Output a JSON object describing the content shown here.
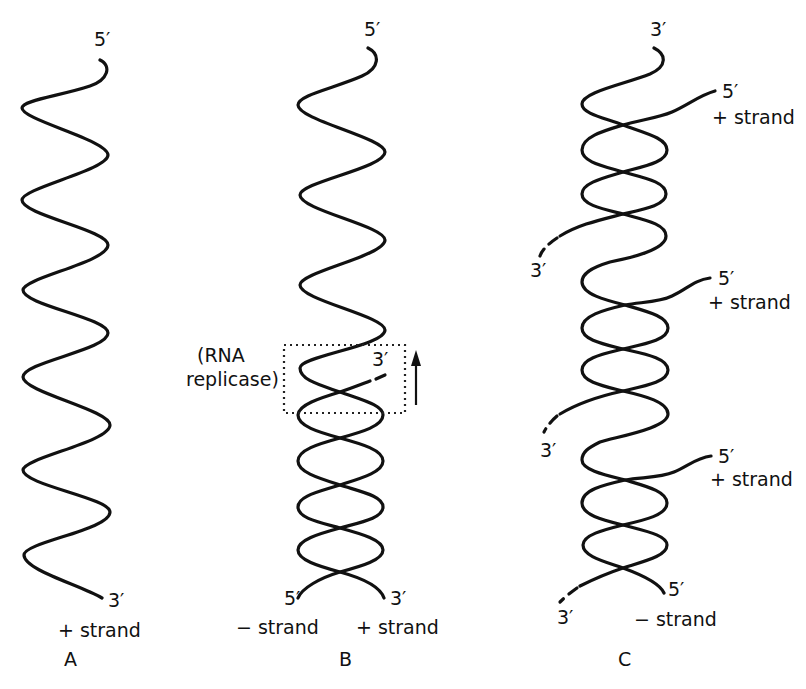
{
  "figure": {
    "panels": [
      {
        "id": "A",
        "label": "A",
        "top_end": "5′",
        "bottom_end": "3′",
        "strand_label": "+ strand"
      },
      {
        "id": "B",
        "label": "B",
        "top_end": "5′",
        "enzyme_label_line1": "(RNA",
        "enzyme_label_line2": "replicase)",
        "growing_end": "3′",
        "bottom_left_end": "5′",
        "bottom_right_end": "3′",
        "minus_strand_label": "− strand",
        "plus_strand_label": "+ strand"
      },
      {
        "id": "C",
        "label": "C",
        "top_end": "3′",
        "new_strands": [
          {
            "end5": "5′",
            "label": "+ strand",
            "end3": "3′"
          },
          {
            "end5": "5′",
            "label": "+ strand",
            "end3": "3′"
          },
          {
            "end5": "5′",
            "label": "+ strand",
            "end3": "3′"
          }
        ],
        "bottom_right_end": "5′",
        "minus_strand_label": "− strand"
      }
    ]
  }
}
